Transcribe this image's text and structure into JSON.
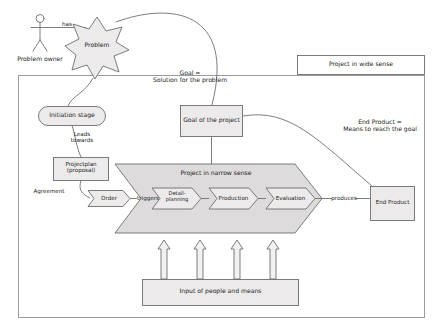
{
  "diagram": {
    "title_hidden": "",
    "actor": {
      "label": "Problem owner"
    },
    "relations": {
      "has": "has",
      "leads_towards": "Leads\ntowards",
      "agreement": "Agreement",
      "triggers": "triggers",
      "produces": "produces"
    },
    "nodes": {
      "problem_star": "Problem",
      "initiation_stage": "Initiation stage",
      "projectplan": "Projectplan\n(proposal)",
      "order": "Order",
      "goal_of_project": "Goal of the project",
      "end_product": "End Product",
      "input_box": "Input of people and means",
      "project_wide_sense": "Project in wide sense",
      "project_narrow_sense": "Project in narrow sense"
    },
    "phases": [
      {
        "label": "Detail-\nplanning"
      },
      {
        "label": "Production"
      },
      {
        "label": "Evaluation"
      }
    ],
    "annotations": {
      "goal_note": "Goal =\nSolution for the problem",
      "end_product_note": "End Product =\nMeans to reach the goal"
    },
    "colors": {
      "stroke": "#6e6e6e",
      "fill_light": "#eceaea",
      "fill_band": "#dddbdb",
      "background": "#ffffff",
      "text": "#1a1a1a"
    }
  }
}
